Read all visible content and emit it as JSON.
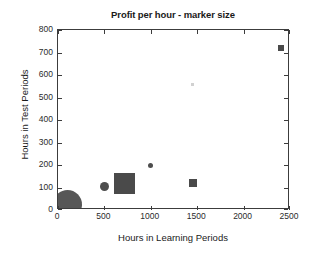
{
  "chart_data": {
    "type": "scatter",
    "title": "Profit per hour - marker size",
    "xlabel": "Hours in Learning Periods",
    "ylabel": "Hours in Test Periods",
    "xlim": [
      0,
      2500
    ],
    "ylim": [
      0,
      800
    ],
    "xticks": [
      0,
      500,
      1000,
      1500,
      2000,
      2500
    ],
    "yticks": [
      0,
      100,
      200,
      300,
      400,
      500,
      600,
      700,
      800
    ],
    "xticklabels": [
      "0",
      "500",
      "1000",
      "1500",
      "2000",
      "2500"
    ],
    "yticklabels": [
      "0",
      "100",
      "200",
      "300",
      "400",
      "500",
      "600",
      "700",
      "800"
    ],
    "grid": false,
    "legend": false,
    "marker_color": "#4d4d4d",
    "size_encodes": "profit per hour",
    "points": [
      {
        "label": "point-1",
        "x": 100,
        "y": 25,
        "size_px": 29,
        "shape": "circle",
        "color": "#575757",
        "opacity": 1.0
      },
      {
        "label": "point-2",
        "x": 500,
        "y": 103,
        "size_px": 9,
        "shape": "circle",
        "color": "#4d4d4d",
        "opacity": 1.0
      },
      {
        "label": "point-3",
        "x": 720,
        "y": 118,
        "size_px": 21,
        "shape": "square",
        "color": "#4a4a4a",
        "opacity": 1.0
      },
      {
        "label": "point-4",
        "x": 1000,
        "y": 200,
        "size_px": 5,
        "shape": "circle",
        "color": "#4d4d4d",
        "opacity": 1.0
      },
      {
        "label": "point-5",
        "x": 1450,
        "y": 120,
        "size_px": 8,
        "shape": "square",
        "color": "#4a4a4a",
        "opacity": 1.0
      },
      {
        "label": "point-6",
        "x": 1450,
        "y": 560,
        "size_px": 3,
        "shape": "square",
        "color": "#9a9a9a",
        "opacity": 0.45
      },
      {
        "label": "point-7",
        "x": 2400,
        "y": 720,
        "size_px": 6,
        "shape": "square",
        "color": "#4a4a4a",
        "opacity": 1.0
      }
    ]
  }
}
